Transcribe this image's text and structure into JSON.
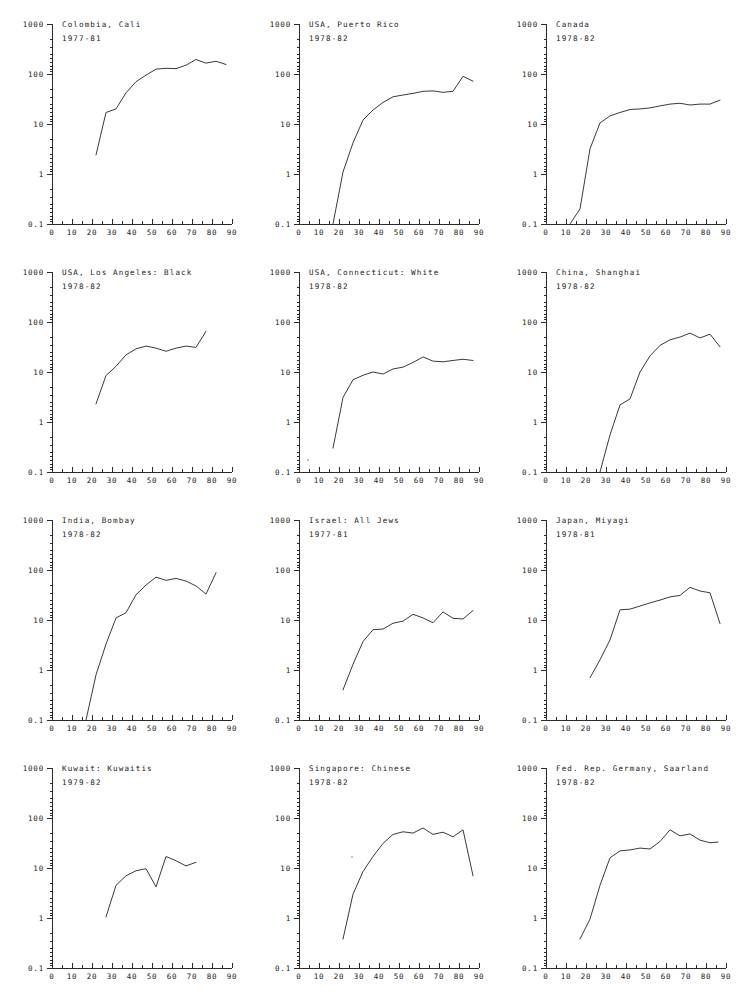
{
  "figure": {
    "type": "small-multiples",
    "rows": 4,
    "cols": 3,
    "background": "#ffffff",
    "line_color": "#3a3a3a",
    "axis_color": "#2b2b2b",
    "text_color": "#1a1a1a"
  },
  "axes": {
    "y_scale": "log",
    "y_tick_labels": [
      "1000",
      "100",
      "10",
      "1",
      "0.1"
    ],
    "y_tick_values": [
      1000,
      100,
      10,
      1,
      0.1
    ],
    "ylim": [
      0.1,
      1000
    ],
    "x_scale": "linear",
    "x_tick_labels": [
      "0",
      "10",
      "20",
      "30",
      "40",
      "50",
      "60",
      "70",
      "80",
      "90"
    ],
    "x_tick_values": [
      0,
      10,
      20,
      30,
      40,
      50,
      60,
      70,
      80,
      90
    ],
    "x_minor_step": 5,
    "xlim": [
      0,
      90
    ],
    "xlabel": "",
    "ylabel": "",
    "grid": false,
    "legend": "none"
  },
  "chart_data": [
    {
      "type": "line",
      "index": 0,
      "title": "Colombia, Cali",
      "subtitle": "1977-81",
      "xlabel": "",
      "ylabel": "",
      "xlim": [
        0,
        90
      ],
      "ylim": [
        0.1,
        1000
      ],
      "x": [
        22,
        27,
        32,
        37,
        42,
        47,
        52,
        57,
        62,
        67,
        72,
        77,
        82,
        87
      ],
      "values": [
        2.4,
        17,
        20,
        42,
        70,
        95,
        125,
        130,
        128,
        150,
        195,
        165,
        180,
        155
      ]
    },
    {
      "type": "line",
      "index": 1,
      "title": "USA, Puerto Rico",
      "subtitle": "1978-82",
      "xlabel": "",
      "ylabel": "",
      "xlim": [
        0,
        90
      ],
      "ylim": [
        0.1,
        1000
      ],
      "x": [
        17,
        22,
        27,
        32,
        37,
        42,
        47,
        52,
        57,
        62,
        67,
        72,
        77,
        82,
        87
      ],
      "values": [
        0.1,
        1.1,
        4.2,
        12,
        19,
        27,
        35,
        38,
        41,
        45,
        46,
        43,
        45,
        90,
        72
      ]
    },
    {
      "type": "line",
      "index": 2,
      "title": "Canada",
      "subtitle": "1978-82",
      "xlabel": "",
      "ylabel": "",
      "xlim": [
        0,
        90
      ],
      "ylim": [
        0.1,
        1000
      ],
      "x": [
        12,
        17,
        22,
        27,
        32,
        37,
        42,
        47,
        52,
        57,
        62,
        67,
        72,
        77,
        82,
        87
      ],
      "values": [
        0.1,
        0.2,
        3.2,
        10.5,
        14.5,
        17,
        19.5,
        20,
        21,
        23,
        25,
        26,
        24,
        25,
        25,
        30
      ]
    },
    {
      "type": "line",
      "index": 3,
      "title": "USA, Los Angeles: Black",
      "subtitle": "1978-82",
      "xlabel": "",
      "ylabel": "",
      "xlim": [
        0,
        90
      ],
      "ylim": [
        0.1,
        1000
      ],
      "x": [
        22,
        27,
        32,
        37,
        42,
        47,
        52,
        57,
        62,
        67,
        72,
        77
      ],
      "values": [
        2.3,
        8.5,
        13,
        22,
        29,
        33,
        30,
        26,
        30,
        33,
        31,
        65
      ]
    },
    {
      "type": "line",
      "index": 4,
      "title": "USA, Connecticut: White",
      "subtitle": "1978-82",
      "xlabel": "",
      "ylabel": "",
      "xlim": [
        0,
        90
      ],
      "ylim": [
        0.1,
        1000
      ],
      "x": [
        17,
        22,
        27,
        32,
        37,
        42,
        47,
        52,
        57,
        62,
        67,
        72,
        77,
        82,
        87
      ],
      "values": [
        0.3,
        3.1,
        7.0,
        8.6,
        10.0,
        9.1,
        11.5,
        12.5,
        15.5,
        20,
        16.5,
        16,
        17,
        18,
        17
      ]
    },
    {
      "type": "line",
      "index": 5,
      "title": "China, Shanghai",
      "subtitle": "1978-82",
      "xlabel": "",
      "ylabel": "",
      "xlim": [
        0,
        90
      ],
      "ylim": [
        0.1,
        1000
      ],
      "x": [
        27,
        32,
        37,
        42,
        47,
        52,
        57,
        62,
        67,
        72,
        77,
        82,
        87
      ],
      "values": [
        0.1,
        0.55,
        2.2,
        2.9,
        10,
        21,
        34,
        44,
        50,
        60,
        48,
        57,
        32
      ]
    },
    {
      "type": "line",
      "index": 6,
      "title": "India, Bombay",
      "subtitle": "1978-82",
      "xlabel": "",
      "ylabel": "",
      "xlim": [
        0,
        90
      ],
      "ylim": [
        0.1,
        1000
      ],
      "x": [
        17,
        22,
        27,
        32,
        37,
        42,
        47,
        52,
        57,
        62,
        67,
        72,
        77,
        82
      ],
      "values": [
        0.1,
        0.8,
        3.3,
        11,
        14,
        32,
        50,
        72,
        62,
        68,
        60,
        48,
        33,
        88
      ]
    },
    {
      "type": "line",
      "index": 7,
      "title": "Israel: All Jews",
      "subtitle": "1977-81",
      "xlabel": "",
      "ylabel": "",
      "xlim": [
        0,
        90
      ],
      "ylim": [
        0.1,
        1000
      ],
      "x": [
        22,
        27,
        32,
        37,
        42,
        47,
        52,
        57,
        62,
        67,
        72,
        77,
        82,
        87
      ],
      "values": [
        0.4,
        1.3,
        3.7,
        6.4,
        6.6,
        8.6,
        9.5,
        13,
        11,
        8.8,
        14.5,
        10.8,
        10.5,
        15.5
      ]
    },
    {
      "type": "line",
      "index": 8,
      "title": "Japan, Miyagi",
      "subtitle": "1978-81",
      "xlabel": "",
      "ylabel": "",
      "xlim": [
        0,
        90
      ],
      "ylim": [
        0.1,
        1000
      ],
      "x": [
        22,
        27,
        32,
        37,
        42,
        47,
        52,
        57,
        62,
        67,
        72,
        77,
        82,
        87
      ],
      "values": [
        0.7,
        1.6,
        4.0,
        16,
        16.5,
        19,
        22,
        25,
        29,
        31,
        45,
        38,
        35,
        8.5
      ]
    },
    {
      "type": "line",
      "index": 9,
      "title": "Kuwait: Kuwaitis",
      "subtitle": "1979-82",
      "xlabel": "",
      "ylabel": "",
      "xlim": [
        0,
        90
      ],
      "ylim": [
        0.1,
        1000
      ],
      "x": [
        27,
        32,
        37,
        42,
        47,
        52,
        57,
        62,
        67,
        72
      ],
      "values": [
        1.05,
        4.5,
        7.0,
        8.8,
        9.7,
        4.2,
        17,
        14,
        11,
        13
      ]
    },
    {
      "type": "line",
      "index": 10,
      "title": "Singapore: Chinese",
      "subtitle": "1978-82",
      "xlabel": "",
      "ylabel": "",
      "xlim": [
        0,
        90
      ],
      "ylim": [
        0.1,
        1000
      ],
      "x": [
        22,
        27,
        32,
        37,
        42,
        47,
        52,
        57,
        62,
        67,
        72,
        77,
        82,
        87
      ],
      "values": [
        0.38,
        3.0,
        8.5,
        17,
        31,
        47,
        53,
        50,
        63,
        47,
        52,
        42,
        58,
        7.0
      ]
    },
    {
      "type": "line",
      "index": 11,
      "title": "Fed. Rep. Germany, Saarland",
      "subtitle": "1978-82",
      "xlabel": "",
      "ylabel": "",
      "xlim": [
        0,
        90
      ],
      "ylim": [
        0.1,
        1000
      ],
      "x": [
        17,
        22,
        27,
        32,
        37,
        42,
        47,
        52,
        57,
        62,
        67,
        72,
        77,
        82,
        86
      ],
      "values": [
        0.38,
        0.95,
        4.5,
        16,
        22,
        23,
        25,
        24,
        34,
        58,
        44,
        48,
        36,
        32,
        33
      ]
    }
  ]
}
